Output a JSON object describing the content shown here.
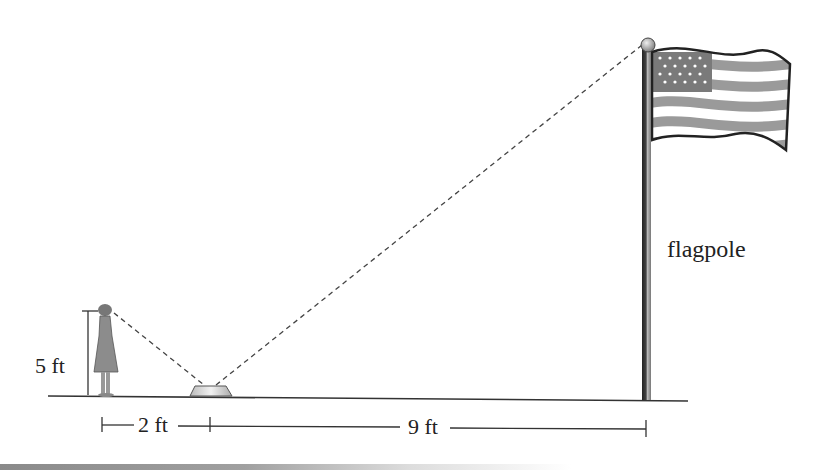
{
  "diagram": {
    "type": "similar-triangles-mirror-problem",
    "labels": {
      "person_height": "5 ft",
      "person_to_mirror": "2 ft",
      "mirror_to_pole": "9 ft",
      "flagpole": "flagpole"
    },
    "objects": [
      "person",
      "mirror",
      "flagpole",
      "flag"
    ],
    "colors": {
      "line": "#333333",
      "dash": "#444444",
      "figure_gray": "#8c8c8c",
      "flag_stripe": "#9a9a9a",
      "canton": "#7a7a7a"
    }
  }
}
